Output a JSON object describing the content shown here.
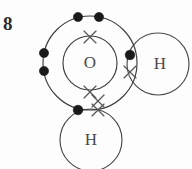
{
  "page": {
    "question_number": "8",
    "background_color": "#fdfdfd",
    "width": 192,
    "height": 169
  },
  "diagram": {
    "type": "dot-and-cross",
    "molecule": "H2O",
    "dot_color": "#1a1a1a",
    "cross_color": "#555555",
    "shell_color": "#3d3d3d",
    "atoms": [
      {
        "id": "oxygen",
        "symbol": "O",
        "cx": 90,
        "cy": 63,
        "label_size": 17,
        "shells": [
          {
            "name": "inner-shell",
            "radius": 27
          },
          {
            "name": "outer-shell",
            "radius": 47
          }
        ]
      },
      {
        "id": "hydrogen-right",
        "symbol": "H",
        "cx": 158,
        "cy": 64,
        "radius": 31,
        "label_size": 17
      },
      {
        "id": "hydrogen-bottom",
        "symbol": "H",
        "cx": 91,
        "cy": 140,
        "radius": 31,
        "label_size": 17
      }
    ],
    "electrons": [
      {
        "id": "dot-top-left",
        "mark": "dot",
        "x": 78,
        "y": 17
      },
      {
        "id": "dot-top-right",
        "mark": "dot",
        "x": 99,
        "y": 17
      },
      {
        "id": "dot-left-upper",
        "mark": "dot",
        "x": 44,
        "y": 53
      },
      {
        "id": "dot-left-lower",
        "mark": "dot",
        "x": 44,
        "y": 71
      },
      {
        "id": "dot-bond-right",
        "mark": "dot",
        "x": 130,
        "y": 55
      },
      {
        "id": "dot-bond-bottom",
        "mark": "dot",
        "x": 78,
        "y": 110
      },
      {
        "id": "cross-inner-top",
        "mark": "cross",
        "x": 90,
        "y": 37
      },
      {
        "id": "cross-inner-bottom",
        "mark": "cross",
        "x": 90,
        "y": 92
      },
      {
        "id": "cross-bond-right",
        "mark": "cross",
        "x": 130,
        "y": 72
      },
      {
        "id": "cross-bond-bottom",
        "mark": "cross",
        "x": 98,
        "y": 110
      },
      {
        "id": "cross-bond-bottom-upper",
        "mark": "cross",
        "x": 98,
        "y": 101
      }
    ]
  }
}
